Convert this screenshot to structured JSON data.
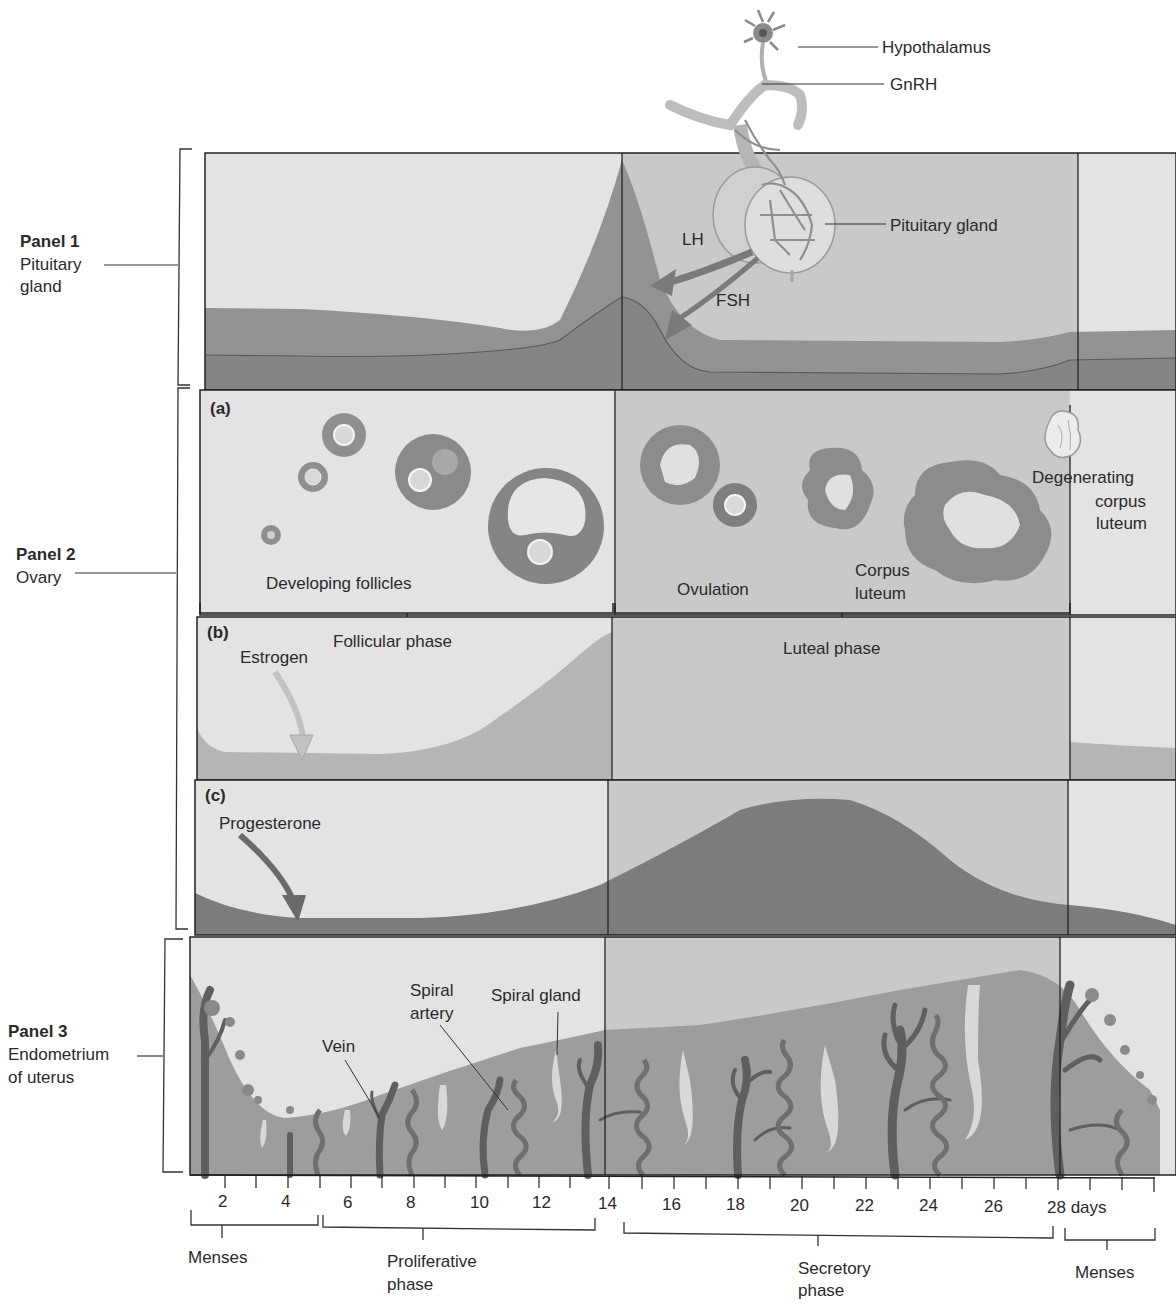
{
  "figure": {
    "panels": [
      {
        "id": "panel1",
        "title": "Panel 1",
        "subtitle_line1": "Pituitary",
        "subtitle_line2": "gland"
      },
      {
        "id": "panel2",
        "title": "Panel 2",
        "subtitle_line1": "Ovary"
      },
      {
        "id": "panel3",
        "title": "Panel 3",
        "subtitle_line1": "Endometrium",
        "subtitle_line2": "of uterus"
      }
    ],
    "top_labels": {
      "hypothalamus": "Hypothalamus",
      "gnrh": "GnRH",
      "pituitary_gland": "Pituitary gland",
      "lh": "LH",
      "fsh": "FSH"
    },
    "ovary_labels": {
      "section_a": "(a)",
      "developing_follicles": "Developing follicles",
      "ovulation": "Ovulation",
      "corpus_luteum_1": "Corpus",
      "corpus_luteum_2": "luteum",
      "degenerating_1": "Degenerating",
      "degenerating_2": "corpus",
      "degenerating_3": "luteum"
    },
    "hormone_labels": {
      "section_b": "(b)",
      "follicular_phase": "Follicular phase",
      "luteal_phase": "Luteal phase",
      "estrogen": "Estrogen",
      "section_c": "(c)",
      "progesterone": "Progesterone"
    },
    "uterus_labels": {
      "spiral_artery_1": "Spiral",
      "spiral_artery_2": "artery",
      "spiral_gland": "Spiral gland",
      "vein": "Vein"
    },
    "axis": {
      "ticks": [
        "2",
        "4",
        "6",
        "8",
        "10",
        "12",
        "14",
        "16",
        "18",
        "20",
        "22",
        "24",
        "26",
        "28 days"
      ]
    },
    "phases": {
      "menses_start": "Menses",
      "proliferative_1": "Proliferative",
      "proliferative_2": "phase",
      "secretory_1": "Secretory",
      "secretory_2": "phase",
      "menses_end": "Menses"
    }
  },
  "colors": {
    "background_light": "#e3e3e3",
    "background_luteal": "#c9c9c9",
    "curve_medium": "#9a9a9a",
    "curve_dark": "#7c7c7c",
    "estrogen_fill": "#b5b5b5",
    "endometrium": "#9d9d9d",
    "vessel": "#5f5f5f",
    "gland": "#d8d8d8",
    "line": "#222222"
  }
}
